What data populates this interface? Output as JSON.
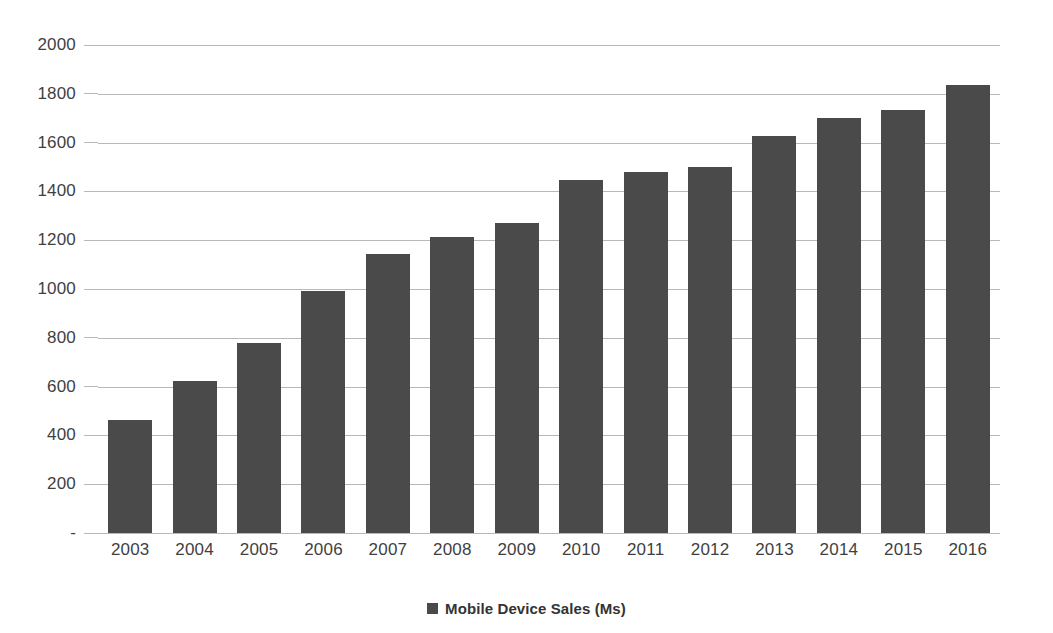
{
  "chart_data": {
    "type": "bar",
    "title": "",
    "xlabel": "",
    "ylabel": "",
    "categories": [
      "2003",
      "2004",
      "2005",
      "2006",
      "2007",
      "2008",
      "2009",
      "2010",
      "2011",
      "2012",
      "2013",
      "2014",
      "2015",
      "2016"
    ],
    "values": [
      465,
      625,
      780,
      990,
      1145,
      1215,
      1270,
      1445,
      1478,
      1500,
      1628,
      1700,
      1735,
      1838
    ],
    "series": [
      {
        "name": "Mobile Device Sales (Ms)",
        "color": "#4a4a4a",
        "values": [
          465,
          625,
          780,
          990,
          1145,
          1215,
          1270,
          1445,
          1478,
          1500,
          1628,
          1700,
          1735,
          1838
        ]
      }
    ],
    "ylim": [
      0,
      2000
    ],
    "ytick_values": [
      0,
      200,
      400,
      600,
      800,
      1000,
      1200,
      1400,
      1600,
      1800,
      2000
    ],
    "ytick_labels": [
      "-",
      "200",
      "400",
      "600",
      "800",
      "1000",
      "1200",
      "1400",
      "1600",
      "1800",
      "2000"
    ],
    "grid": true,
    "grid_axis": "y",
    "legend_position": "bottom",
    "bar_color": "#4a4a4a",
    "gridline_color": "#a6a6a6",
    "background_color": "#ffffff"
  },
  "legend": {
    "items": [
      {
        "label": "Mobile Device Sales (Ms)",
        "marker": "square-marker",
        "color": "#4a4a4a"
      }
    ]
  }
}
